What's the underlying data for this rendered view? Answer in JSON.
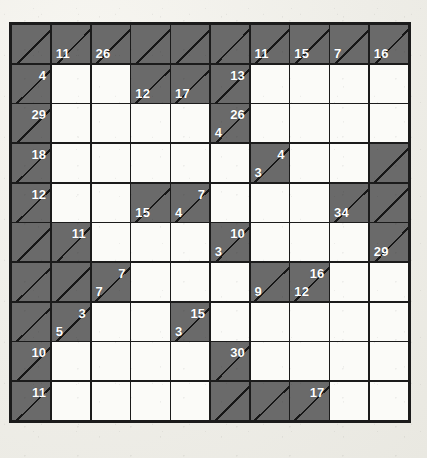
{
  "puzzle": {
    "type": "kakuro",
    "rows": 10,
    "cols": 10,
    "colors": {
      "page_background": "#eeede7",
      "clue_cell": "#6a6a6a",
      "entry_cell": "#fbfbf8",
      "grid_line": "#1b1b1b",
      "clue_text": "#ffffff"
    },
    "grid": [
      [
        {
          "kind": "clue",
          "across": null,
          "down": null
        },
        {
          "kind": "clue",
          "across": null,
          "down": "11"
        },
        {
          "kind": "clue",
          "across": null,
          "down": "26"
        },
        {
          "kind": "clue",
          "across": null,
          "down": null
        },
        {
          "kind": "clue",
          "across": null,
          "down": null
        },
        {
          "kind": "clue",
          "across": null,
          "down": null
        },
        {
          "kind": "clue",
          "across": null,
          "down": "11"
        },
        {
          "kind": "clue",
          "across": null,
          "down": "15"
        },
        {
          "kind": "clue",
          "across": null,
          "down": "7"
        },
        {
          "kind": "clue",
          "across": null,
          "down": "16"
        }
      ],
      [
        {
          "kind": "clue",
          "across": "4",
          "down": null
        },
        {
          "kind": "entry"
        },
        {
          "kind": "entry"
        },
        {
          "kind": "clue",
          "across": null,
          "down": "12"
        },
        {
          "kind": "clue",
          "across": null,
          "down": "17"
        },
        {
          "kind": "clue",
          "across": "13",
          "down": null
        },
        {
          "kind": "entry"
        },
        {
          "kind": "entry"
        },
        {
          "kind": "entry"
        },
        {
          "kind": "entry"
        }
      ],
      [
        {
          "kind": "clue",
          "across": "29",
          "down": null
        },
        {
          "kind": "entry"
        },
        {
          "kind": "entry"
        },
        {
          "kind": "entry"
        },
        {
          "kind": "entry"
        },
        {
          "kind": "clue",
          "across": "26",
          "down": "4"
        },
        {
          "kind": "entry"
        },
        {
          "kind": "entry"
        },
        {
          "kind": "entry"
        },
        {
          "kind": "entry"
        }
      ],
      [
        {
          "kind": "clue",
          "across": "18",
          "down": null
        },
        {
          "kind": "entry"
        },
        {
          "kind": "entry"
        },
        {
          "kind": "entry"
        },
        {
          "kind": "entry"
        },
        {
          "kind": "entry"
        },
        {
          "kind": "clue",
          "across": "4",
          "down": "3"
        },
        {
          "kind": "entry"
        },
        {
          "kind": "entry"
        },
        {
          "kind": "clue",
          "across": null,
          "down": null
        }
      ],
      [
        {
          "kind": "clue",
          "across": "12",
          "down": null
        },
        {
          "kind": "entry"
        },
        {
          "kind": "entry"
        },
        {
          "kind": "clue",
          "across": null,
          "down": "15"
        },
        {
          "kind": "clue",
          "across": "7",
          "down": "4"
        },
        {
          "kind": "entry"
        },
        {
          "kind": "entry"
        },
        {
          "kind": "entry"
        },
        {
          "kind": "clue",
          "across": null,
          "down": "34"
        },
        {
          "kind": "clue",
          "across": null,
          "down": null
        }
      ],
      [
        {
          "kind": "clue",
          "across": null,
          "down": null
        },
        {
          "kind": "clue",
          "across": "11",
          "down": null
        },
        {
          "kind": "entry"
        },
        {
          "kind": "entry"
        },
        {
          "kind": "entry"
        },
        {
          "kind": "clue",
          "across": "10",
          "down": "3"
        },
        {
          "kind": "entry"
        },
        {
          "kind": "entry"
        },
        {
          "kind": "entry"
        },
        {
          "kind": "clue",
          "across": null,
          "down": "29"
        }
      ],
      [
        {
          "kind": "clue",
          "across": null,
          "down": null
        },
        {
          "kind": "clue",
          "across": null,
          "down": null
        },
        {
          "kind": "clue",
          "across": "7",
          "down": "7"
        },
        {
          "kind": "entry"
        },
        {
          "kind": "entry"
        },
        {
          "kind": "entry"
        },
        {
          "kind": "clue",
          "across": null,
          "down": "9"
        },
        {
          "kind": "clue",
          "across": "16",
          "down": "12"
        },
        {
          "kind": "entry"
        },
        {
          "kind": "entry"
        }
      ],
      [
        {
          "kind": "clue",
          "across": null,
          "down": null
        },
        {
          "kind": "clue",
          "across": "3",
          "down": "5"
        },
        {
          "kind": "entry"
        },
        {
          "kind": "entry"
        },
        {
          "kind": "clue",
          "across": "15",
          "down": "3"
        },
        {
          "kind": "entry"
        },
        {
          "kind": "entry"
        },
        {
          "kind": "entry"
        },
        {
          "kind": "entry"
        },
        {
          "kind": "entry"
        }
      ],
      [
        {
          "kind": "clue",
          "across": "10",
          "down": null
        },
        {
          "kind": "entry"
        },
        {
          "kind": "entry"
        },
        {
          "kind": "entry"
        },
        {
          "kind": "entry"
        },
        {
          "kind": "clue",
          "across": "30",
          "down": null
        },
        {
          "kind": "entry"
        },
        {
          "kind": "entry"
        },
        {
          "kind": "entry"
        },
        {
          "kind": "entry"
        }
      ],
      [
        {
          "kind": "clue",
          "across": "11",
          "down": null
        },
        {
          "kind": "entry"
        },
        {
          "kind": "entry"
        },
        {
          "kind": "entry"
        },
        {
          "kind": "entry"
        },
        {
          "kind": "clue",
          "across": null,
          "down": null
        },
        {
          "kind": "clue",
          "across": null,
          "down": null
        },
        {
          "kind": "clue",
          "across": "17",
          "down": null
        },
        {
          "kind": "entry"
        },
        {
          "kind": "entry"
        }
      ]
    ]
  }
}
